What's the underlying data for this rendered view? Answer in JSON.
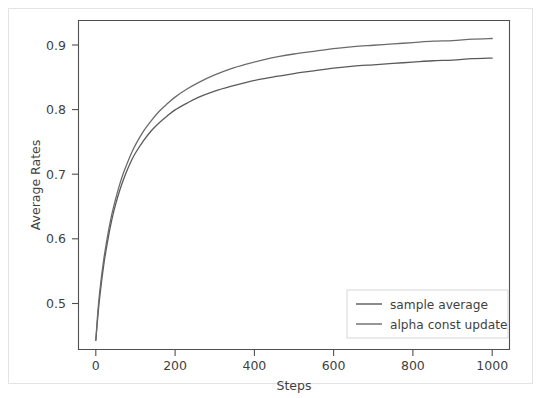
{
  "figure": {
    "width": 543,
    "height": 398,
    "background": "#ffffff",
    "outer_border_color": "#e3e3e3",
    "axes_spine_color": "#4f4f4f",
    "text_color": "#3f3f3f"
  },
  "chart_data": {
    "type": "line",
    "title": "",
    "xlabel": "Steps",
    "ylabel": "Average Rates",
    "xlim": [
      -45,
      1045
    ],
    "ylim": [
      0.4555,
      0.9455
    ],
    "xticks": [
      0,
      200,
      400,
      600,
      800,
      1000
    ],
    "xticklabels": [
      "0",
      "200",
      "400",
      "600",
      "800",
      "1000"
    ],
    "yticks": [
      0.5,
      0.6,
      0.7,
      0.8,
      0.9
    ],
    "yticklabels": [
      "0.5",
      "0.6",
      "0.7",
      "0.8",
      "0.9"
    ],
    "grid": false,
    "legend_position": "lower right",
    "x": [
      0,
      5,
      10,
      20,
      30,
      40,
      50,
      60,
      70,
      80,
      90,
      100,
      120,
      140,
      160,
      180,
      200,
      230,
      260,
      300,
      340,
      380,
      420,
      460,
      500,
      550,
      600,
      650,
      700,
      750,
      800,
      850,
      900,
      950,
      1000
    ],
    "series": [
      {
        "name": "sample average",
        "color": "#5a5a5a",
        "linewidth": 1.3,
        "values": [
          0.47,
          0.505,
          0.535,
          0.582,
          0.618,
          0.648,
          0.672,
          0.692,
          0.709,
          0.724,
          0.737,
          0.748,
          0.766,
          0.781,
          0.793,
          0.803,
          0.812,
          0.822,
          0.831,
          0.84,
          0.847,
          0.853,
          0.858,
          0.862,
          0.866,
          0.87,
          0.874,
          0.877,
          0.879,
          0.881,
          0.883,
          0.885,
          0.886,
          0.888,
          0.889
        ]
      },
      {
        "name": "alpha const update",
        "color": "#6b6b6b",
        "linewidth": 1.3,
        "values": [
          0.47,
          0.512,
          0.543,
          0.59,
          0.626,
          0.656,
          0.68,
          0.701,
          0.719,
          0.734,
          0.748,
          0.76,
          0.78,
          0.796,
          0.81,
          0.821,
          0.831,
          0.843,
          0.853,
          0.864,
          0.873,
          0.88,
          0.886,
          0.891,
          0.895,
          0.899,
          0.903,
          0.906,
          0.908,
          0.91,
          0.912,
          0.914,
          0.915,
          0.917,
          0.918
        ]
      }
    ]
  },
  "legend": {
    "entries": [
      {
        "label": "sample average"
      },
      {
        "label": "alpha const update"
      }
    ],
    "border_color": "#d6d6d6",
    "background": "#ffffff"
  }
}
